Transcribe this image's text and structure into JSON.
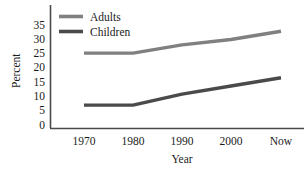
{
  "chart_data": {
    "type": "line",
    "title": "",
    "xlabel": "Year",
    "ylabel": "Percent",
    "categories": [
      "1970",
      "1980",
      "1990",
      "2000",
      "Now"
    ],
    "x": [
      "1970",
      "1980",
      "1990",
      "2000",
      "Now"
    ],
    "series": [
      {
        "name": "Adults",
        "values": [
          26,
          26,
          29,
          31,
          34
        ],
        "color": "#808080"
      },
      {
        "name": "Children",
        "values": [
          7,
          7,
          11,
          14,
          17
        ],
        "color": "#4a4a4a"
      }
    ],
    "yticks": [
      0,
      5,
      10,
      15,
      20,
      25,
      30,
      35
    ],
    "ytick_labels": [
      "0",
      "5",
      "10",
      "15",
      "20",
      "25",
      "30",
      "35"
    ],
    "ylim": [
      0,
      37
    ],
    "grid": false,
    "legend_position": "top-left-inside"
  },
  "axes": {
    "y_title": "Percent",
    "x_title": "Year",
    "y_tick_labels": [
      "35",
      "30",
      "25",
      "20",
      "15",
      "10",
      "5",
      "0"
    ],
    "x_tick_labels": [
      "1970",
      "1980",
      "1990",
      "2000",
      "Now"
    ]
  },
  "legend": {
    "entries": [
      {
        "label": "Adults",
        "color": "#808080"
      },
      {
        "label": "Children",
        "color": "#4a4a4a"
      }
    ]
  },
  "colors": {
    "adults": "#808080",
    "children": "#4a4a4a",
    "axis": "#4a4a4a",
    "text": "#1a1a1a",
    "background": "#ffffff"
  }
}
